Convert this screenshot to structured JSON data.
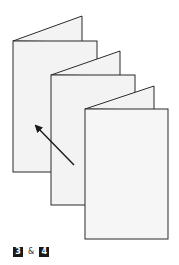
{
  "figure": {
    "colors": {
      "stroke": "#2b2b2b",
      "page_fill": "#f3f3f3",
      "arrow": "#1a1a1a",
      "badge_bg": "#1a1a1a",
      "badge_text": "#ffffff"
    }
  },
  "caption": {
    "step_a": "3",
    "connector": "&",
    "step_b": "4"
  }
}
